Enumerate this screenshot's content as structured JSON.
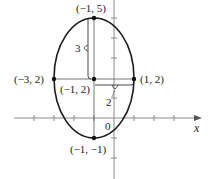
{
  "figure": {
    "type": "ellipse-graph",
    "axes": {
      "x_label": "x",
      "origin_label": "0",
      "x_range": [
        -4,
        4
      ],
      "y_range": [
        -2,
        6
      ]
    },
    "ellipse": {
      "center": "(-1, 2)",
      "semi_major_vertical": 3,
      "semi_minor_horizontal": 2
    },
    "points": {
      "top": "(−1, 5)",
      "bottom": "(−1, −1)",
      "left": "(−3, 2)",
      "right": "(1, 2)",
      "center": "(−1, 2)"
    },
    "dimension_labels": {
      "vertical": "3",
      "horizontal": "2"
    },
    "colors": {
      "curve": "#1a1a1a",
      "axes": "#888888",
      "guides": "#555555"
    }
  }
}
